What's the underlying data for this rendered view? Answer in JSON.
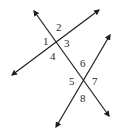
{
  "diagram": {
    "type": "transversal-angles",
    "colors": {
      "line": "#1e1e1e",
      "label": "#2a2a2a",
      "background": "#ffffff"
    },
    "lines": [
      {
        "name": "transversal",
        "x1": 34,
        "y1": 11,
        "x2": 109,
        "y2": 116,
        "arrows": "both"
      },
      {
        "name": "line-upper",
        "x1": 99,
        "y1": 10,
        "x2": 12,
        "y2": 75,
        "arrows": "both"
      },
      {
        "name": "line-lower",
        "x1": 110,
        "y1": 35,
        "x2": 56,
        "y2": 127,
        "arrows": "both"
      }
    ],
    "labels": [
      {
        "text": "1",
        "x": 43,
        "y": 45
      },
      {
        "text": "2",
        "x": 56,
        "y": 31
      },
      {
        "text": "3",
        "x": 64,
        "y": 47
      },
      {
        "text": "4",
        "x": 50,
        "y": 60
      },
      {
        "text": "5",
        "x": 69,
        "y": 85
      },
      {
        "text": "6",
        "x": 80,
        "y": 67
      },
      {
        "text": "7",
        "x": 92,
        "y": 85
      },
      {
        "text": "8",
        "x": 80,
        "y": 102
      }
    ]
  }
}
